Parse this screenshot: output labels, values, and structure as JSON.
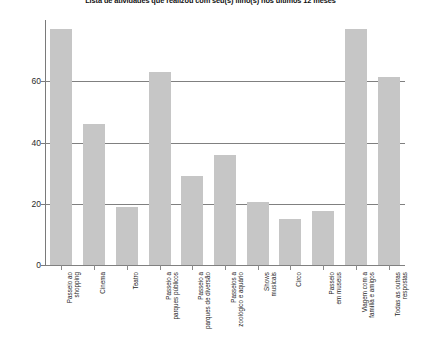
{
  "chart_data": {
    "type": "bar",
    "title": "Lista de atividades que realizou com seu(s) filho(s) nos últimos 12 meses",
    "xlabel": "",
    "ylabel": "",
    "ylim": [
      0,
      80
    ],
    "grid": true,
    "legend": false,
    "yticks": [
      0,
      20,
      40,
      60
    ],
    "ytick_labels": [
      "0",
      "20",
      "40",
      "60"
    ],
    "categories": [
      "Passeio ao shopping",
      "Cinema",
      "Teatro",
      "Passeio a parques públicos",
      "Passeio a parques de diversão",
      "Passeios a zoológico e aquário",
      "Shows musicais",
      "Circo",
      "Passeio em museus",
      "Viagem com a família e amigos",
      "Todas as outras respostas"
    ],
    "category_lines": [
      [
        "Passeio ao",
        "shopping"
      ],
      [
        "Cinema"
      ],
      [
        "Teatro"
      ],
      [
        "Passeio a",
        "parques públicos"
      ],
      [
        "Passeio a",
        "parques de diversão"
      ],
      [
        "Passeios a",
        "zoológico e aquário"
      ],
      [
        "Shows",
        "musicais"
      ],
      [
        "Circo"
      ],
      [
        "Passeio",
        "em museus"
      ],
      [
        "Viagem com a",
        "família e amigos"
      ],
      [
        "Todas as outras",
        "respostas"
      ]
    ],
    "values": [
      77,
      46,
      19,
      63,
      29,
      36,
      20.5,
      15,
      17.5,
      77,
      61.5
    ],
    "bar_color": "#c6c6c6",
    "axis_color": "#7a7a7a",
    "grid_color": "#808080",
    "background": "#ffffff"
  }
}
